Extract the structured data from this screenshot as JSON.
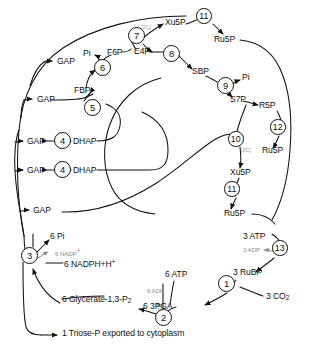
{
  "diagram": {
    "type": "metabolic-pathway-diagram",
    "stroke_color": "#111111",
    "annotation_color": "#8b8b8b",
    "background": "#ffffff"
  },
  "metabolites": [
    {
      "id": "gap1",
      "label": "GAP",
      "x": 57,
      "y": 61
    },
    {
      "id": "gap2",
      "label": "GAP",
      "x": 37,
      "y": 99
    },
    {
      "id": "gap3",
      "label": "GAP",
      "x": 27,
      "y": 141
    },
    {
      "id": "gap4",
      "label": "GAP",
      "x": 27,
      "y": 170
    },
    {
      "id": "gap5",
      "label": "GAP",
      "x": 33,
      "y": 210
    },
    {
      "id": "fbp",
      "label": "FBP",
      "x": 74,
      "y": 90
    },
    {
      "id": "f6p",
      "label": "F6P",
      "x": 107,
      "y": 53
    },
    {
      "id": "pi1",
      "label": "Pi",
      "x": 87,
      "y": 55
    },
    {
      "id": "e4p",
      "label": "E4P",
      "x": 134,
      "y": 52
    },
    {
      "id": "xu5p_a",
      "label": "Xu5P",
      "x": 168,
      "y": 22
    },
    {
      "id": "ru5p_a",
      "label": "Ru5P",
      "x": 215,
      "y": 39
    },
    {
      "id": "sbp",
      "label": "SBP",
      "x": 195,
      "y": 72
    },
    {
      "id": "pi2",
      "label": "Pi",
      "x": 245,
      "y": 78
    },
    {
      "id": "s7p",
      "label": "S7P",
      "x": 232,
      "y": 99
    },
    {
      "id": "r5p",
      "label": "R5P",
      "x": 265,
      "y": 106
    },
    {
      "id": "ru5p_b",
      "label": "Ru5P",
      "x": 266,
      "y": 150
    },
    {
      "id": "xu5p_b",
      "label": "Xu5P",
      "x": 233,
      "y": 172
    },
    {
      "id": "ru5p_c",
      "label": "Ru5P",
      "x": 227,
      "y": 213
    },
    {
      "id": "dhap1",
      "label": "DHAP",
      "x": 75,
      "y": 141
    },
    {
      "id": "dhap2",
      "label": "DHAP",
      "x": 75,
      "y": 170
    },
    {
      "id": "atp3",
      "label": "3 ATP",
      "x": 246,
      "y": 237
    },
    {
      "id": "adp3",
      "label": "3 ADP",
      "x": 245,
      "y": 251,
      "style": "gray"
    },
    {
      "id": "rubp",
      "label": "3 RuBP",
      "x": 236,
      "y": 273
    },
    {
      "id": "co2",
      "label": "3 CO",
      "sub": "2",
      "x": 269,
      "y": 296
    },
    {
      "id": "pga",
      "label": "6 3PGA",
      "x": 146,
      "y": 306
    },
    {
      "id": "atp6",
      "label": "6 ATP",
      "x": 168,
      "y": 275
    },
    {
      "id": "adp6",
      "label": "6 ADP",
      "x": 150,
      "y": 292,
      "style": "gray"
    },
    {
      "id": "pi6",
      "label": "6 Pi",
      "x": 52,
      "y": 237
    },
    {
      "id": "nadp",
      "label": "6 NADP",
      "sup": "+",
      "x": 57,
      "y": 252,
      "style": "gray"
    },
    {
      "id": "nadph",
      "label": "6 NADPH+H",
      "sup": "+",
      "x": 66,
      "y": 264
    },
    {
      "id": "glyc",
      "label": "6 Glycerate-1,3-P",
      "sub": "2",
      "x": 64,
      "y": 300
    },
    {
      "id": "triose",
      "label": "1 Triose-P  exported to cytoplasm",
      "x": 62,
      "y": 334
    }
  ],
  "annotations": [
    {
      "id": "c2_a",
      "label": "[2C]",
      "x": 143,
      "y": 28
    },
    {
      "id": "c2_b",
      "label": "[2C]",
      "x": 243,
      "y": 151
    }
  ],
  "enzymes": [
    {
      "n": "1",
      "x": 226,
      "y": 283
    },
    {
      "n": "2",
      "x": 163,
      "y": 317
    },
    {
      "n": "3",
      "x": 29,
      "y": 255
    },
    {
      "n": "4",
      "x": 53,
      "y": 136
    },
    {
      "n": "4",
      "x": 53,
      "y": 165
    },
    {
      "n": "5",
      "x": 84,
      "y": 105
    },
    {
      "n": "6",
      "x": 101,
      "y": 65
    },
    {
      "n": "7",
      "x": 135,
      "y": 32
    },
    {
      "n": "8",
      "x": 170,
      "y": 51
    },
    {
      "n": "9",
      "x": 224,
      "y": 84
    },
    {
      "n": "10",
      "x": 234,
      "y": 138
    },
    {
      "n": "11",
      "x": 203,
      "y": 15
    },
    {
      "n": "11",
      "x": 231,
      "y": 188
    },
    {
      "n": "12",
      "x": 276,
      "y": 126
    },
    {
      "n": "13",
      "x": 279,
      "y": 247
    }
  ]
}
